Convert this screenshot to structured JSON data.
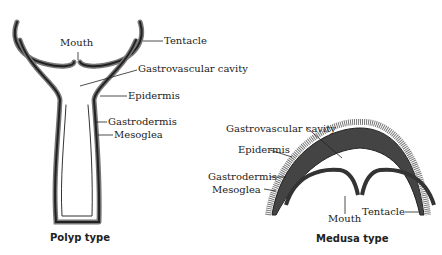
{
  "polyp": {
    "title": "Polyp type",
    "labels": {
      "mouth": "Mouth",
      "tentacle": "Tentacle",
      "gastrovascular": "Gastrovascular cavity",
      "epidermis": "Epidermis",
      "gastrodermis": "Gastrodermis",
      "mesoglea": "Mesoglea"
    }
  },
  "medusa": {
    "title": "Medusa type",
    "labels": {
      "gastrovascular": "Gastrovascular cavity",
      "epidermis": "Epidermis",
      "gastrodermis": "Gastrodermis",
      "mesoglea": "Mesoglea",
      "mouth": "Mouth",
      "tentacle": "Tentacle"
    }
  },
  "colors": {
    "line": "#222222",
    "fill": "#444444",
    "bg": "#ffffff"
  }
}
